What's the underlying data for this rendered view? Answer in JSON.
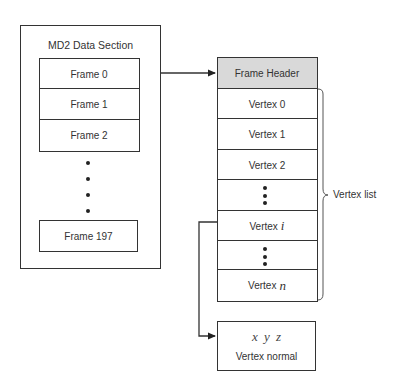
{
  "left_section": {
    "title": "MD2 Data Section",
    "frames": [
      "Frame 0",
      "Frame 1",
      "Frame 2"
    ],
    "last_frame": "Frame 197",
    "ellipsis_dots": 4
  },
  "frame_structure": {
    "header": "Frame Header",
    "header_fill": "#d9d9d9",
    "rows": [
      {
        "prefix": "Vertex",
        "suffix": "0",
        "italic": false
      },
      {
        "prefix": "Vertex",
        "suffix": "1",
        "italic": false
      },
      {
        "prefix": "Vertex",
        "suffix": "2",
        "italic": false
      },
      {
        "ellipsis": true
      },
      {
        "prefix": "Vertex",
        "suffix": "i",
        "italic": true
      },
      {
        "ellipsis": true
      },
      {
        "prefix": "Vertex",
        "suffix": "n",
        "italic": true
      }
    ],
    "brace_label": "Vertex list"
  },
  "vertex_normal": {
    "coords": "x y z",
    "label": "Vertex normal"
  },
  "connections": [
    {
      "from": "Frame 0",
      "to": "Frame Header",
      "type": "arrow"
    },
    {
      "from": "Vertex i",
      "to": "Vertex normal",
      "type": "elbow-arrow"
    }
  ]
}
